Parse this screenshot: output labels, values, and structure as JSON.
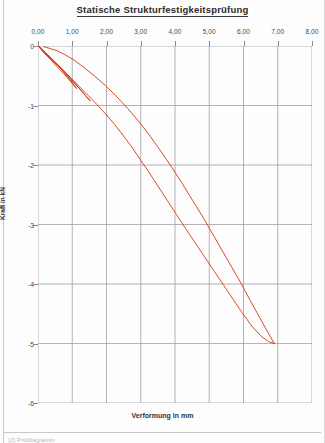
{
  "document": {
    "title": "Statische Strukturfestigkeitsprüfung",
    "footer_caption": "(2) Prüfdiagramm"
  },
  "chart_data": {
    "type": "line",
    "title": "Statische Strukturfestigkeitsprüfung",
    "xlabel": "Verformung in mm",
    "ylabel": "Kraft in kN",
    "xlim": [
      0.0,
      8.0
    ],
    "ylim": [
      -6.0,
      0.0
    ],
    "xticks": [
      "0,00",
      "1,00",
      "2,00",
      "3,00",
      "4,00",
      "5,00",
      "6,00",
      "7,00",
      "8,00"
    ],
    "xtick_values": [
      0.0,
      1.0,
      2.0,
      3.0,
      4.0,
      5.0,
      6.0,
      7.0,
      8.0
    ],
    "yticks": [
      "0",
      "-1",
      "-2",
      "-3",
      "-4",
      "-5",
      "-6"
    ],
    "ytick_values": [
      0,
      -1,
      -2,
      -3,
      -4,
      -5,
      -6
    ],
    "grid": true,
    "grid_color": "#9a9aa2",
    "legend": "none",
    "line_color": "#d8360f",
    "line_width": 0.9,
    "series": [
      {
        "name": "Zyklus 1 - Belastung",
        "points": [
          [
            0.0,
            0.0
          ],
          [
            0.12,
            -0.07
          ],
          [
            0.26,
            -0.15
          ],
          [
            0.42,
            -0.24
          ],
          [
            0.58,
            -0.33
          ],
          [
            0.74,
            -0.43
          ],
          [
            0.9,
            -0.54
          ],
          [
            1.02,
            -0.63
          ],
          [
            1.12,
            -0.71
          ]
        ]
      },
      {
        "name": "Zyklus 1 - Entlastung",
        "points": [
          [
            1.12,
            -0.71
          ],
          [
            1.0,
            -0.63
          ],
          [
            0.84,
            -0.52
          ],
          [
            0.66,
            -0.41
          ],
          [
            0.48,
            -0.3
          ],
          [
            0.32,
            -0.2
          ],
          [
            0.18,
            -0.12
          ],
          [
            0.08,
            -0.05
          ],
          [
            0.02,
            -0.01
          ]
        ]
      },
      {
        "name": "Zyklus 2 - Belastung",
        "points": [
          [
            0.02,
            -0.01
          ],
          [
            0.16,
            -0.08
          ],
          [
            0.32,
            -0.17
          ],
          [
            0.5,
            -0.27
          ],
          [
            0.68,
            -0.37
          ],
          [
            0.86,
            -0.48
          ],
          [
            1.04,
            -0.6
          ],
          [
            1.22,
            -0.72
          ],
          [
            1.4,
            -0.84
          ],
          [
            1.52,
            -0.92
          ]
        ]
      },
      {
        "name": "Zyklus 2 - Entlastung",
        "points": [
          [
            1.52,
            -0.92
          ],
          [
            1.38,
            -0.83
          ],
          [
            1.2,
            -0.71
          ],
          [
            1.0,
            -0.59
          ],
          [
            0.8,
            -0.46
          ],
          [
            0.6,
            -0.34
          ],
          [
            0.42,
            -0.23
          ],
          [
            0.26,
            -0.14
          ],
          [
            0.12,
            -0.06
          ],
          [
            0.04,
            -0.01
          ]
        ]
      },
      {
        "name": "Hauptbelastung",
        "points": [
          [
            0.04,
            -0.01
          ],
          [
            0.2,
            -0.1
          ],
          [
            0.4,
            -0.22
          ],
          [
            0.62,
            -0.35
          ],
          [
            0.86,
            -0.48
          ],
          [
            1.1,
            -0.62
          ],
          [
            1.34,
            -0.76
          ],
          [
            1.58,
            -0.9
          ],
          [
            1.78,
            -1.02
          ],
          [
            2.0,
            -1.16
          ],
          [
            2.24,
            -1.32
          ],
          [
            2.48,
            -1.5
          ],
          [
            2.74,
            -1.7
          ],
          [
            3.0,
            -1.92
          ],
          [
            3.26,
            -2.14
          ],
          [
            3.52,
            -2.37
          ],
          [
            3.78,
            -2.6
          ],
          [
            4.04,
            -2.83
          ],
          [
            4.3,
            -3.06
          ],
          [
            4.58,
            -3.3
          ],
          [
            4.86,
            -3.54
          ],
          [
            5.14,
            -3.78
          ],
          [
            5.42,
            -4.02
          ],
          [
            5.7,
            -4.26
          ],
          [
            5.98,
            -4.5
          ],
          [
            6.26,
            -4.72
          ],
          [
            6.52,
            -4.88
          ],
          [
            6.74,
            -4.97
          ],
          [
            6.9,
            -5.0
          ]
        ]
      },
      {
        "name": "Entlastung nach Maximallast",
        "points": [
          [
            6.9,
            -5.0
          ],
          [
            6.7,
            -4.8
          ],
          [
            6.46,
            -4.55
          ],
          [
            6.2,
            -4.28
          ],
          [
            5.94,
            -4.0
          ],
          [
            5.66,
            -3.72
          ],
          [
            5.38,
            -3.44
          ],
          [
            5.1,
            -3.16
          ],
          [
            4.82,
            -2.88
          ],
          [
            4.52,
            -2.6
          ],
          [
            4.22,
            -2.32
          ],
          [
            3.92,
            -2.05
          ],
          [
            3.6,
            -1.78
          ],
          [
            3.28,
            -1.52
          ],
          [
            2.96,
            -1.28
          ],
          [
            2.62,
            -1.05
          ],
          [
            2.28,
            -0.84
          ],
          [
            1.96,
            -0.66
          ],
          [
            1.64,
            -0.5
          ],
          [
            1.34,
            -0.36
          ],
          [
            1.06,
            -0.24
          ],
          [
            0.8,
            -0.15
          ],
          [
            0.56,
            -0.08
          ],
          [
            0.34,
            -0.04
          ],
          [
            0.16,
            -0.01
          ]
        ]
      }
    ]
  }
}
